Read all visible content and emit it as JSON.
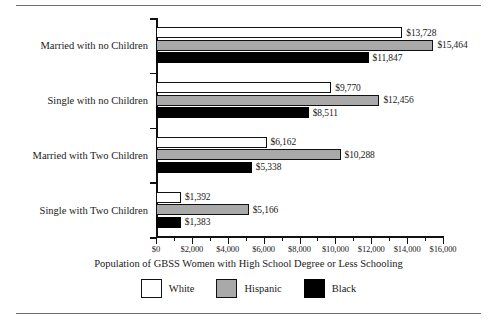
{
  "chart_data": {
    "type": "bar",
    "orientation": "horizontal",
    "title": "",
    "xlabel": "Population of GBSS Women with High School Degree or Less Schooling",
    "ylabel": "",
    "xlim": [
      0,
      16000
    ],
    "xticks": [
      0,
      2000,
      4000,
      6000,
      8000,
      10000,
      12000,
      14000,
      16000
    ],
    "xtick_labels": [
      "$0",
      "$2,000",
      "$4,000",
      "$6,000",
      "$8,000",
      "$10,000",
      "$12,000",
      "$14,000",
      "$16,000"
    ],
    "minor_tick_interval": 1000,
    "grid": false,
    "legend_position": "bottom",
    "categories": [
      "Married with no Children",
      "Single with no Children",
      "Married with Two Children",
      "Single with Two Children"
    ],
    "series": [
      {
        "name": "White",
        "color": "#ffffff",
        "border_color": "#111111",
        "values": [
          13728,
          9770,
          6162,
          1392
        ],
        "labels": [
          "$13,728",
          "$9,770",
          "$6,162",
          "$1,392"
        ]
      },
      {
        "name": "Hispanic",
        "color": "#a9a9a9",
        "border_color": "#111111",
        "values": [
          15464,
          12456,
          10288,
          5166
        ],
        "labels": [
          "$15,464",
          "$12,456",
          "$10,288",
          "$5,166"
        ]
      },
      {
        "name": "Black",
        "color": "#000000",
        "border_color": "#000000",
        "values": [
          11847,
          8511,
          5338,
          1383
        ],
        "labels": [
          "$11,847",
          "$8,511",
          "$5,338",
          "$1,383"
        ]
      }
    ]
  },
  "legend": {
    "items": [
      {
        "label": "White",
        "swatch": "white"
      },
      {
        "label": "Hispanic",
        "swatch": "hispanic"
      },
      {
        "label": "Black",
        "swatch": "black"
      }
    ]
  },
  "axis_title": "Population of GBSS Women with High School Degree or Less Schooling"
}
